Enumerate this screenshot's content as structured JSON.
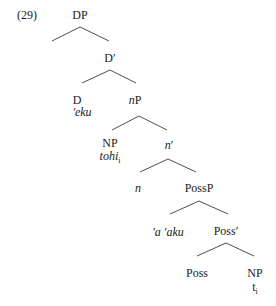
{
  "example_number": "(29)",
  "tree": {
    "nodes": {
      "DP": {
        "label": "DP",
        "x": 80,
        "y": 9
      },
      "Dbar": {
        "label": "D′",
        "x": 110,
        "y": 52
      },
      "D": {
        "label": "D",
        "x": 77,
        "y": 94
      },
      "eku": {
        "label": "'eku",
        "x": 82,
        "y": 106
      },
      "nP_label": {
        "label": "n",
        "x": 134,
        "y": 94
      },
      "nP_suffix": {
        "label": "P"
      },
      "NP1": {
        "label": "NP",
        "x": 110,
        "y": 137
      },
      "tohi": {
        "label": "tohi",
        "subscript": "i",
        "x": 110,
        "y": 150
      },
      "nbar_label": {
        "label": "n",
        "x": 168,
        "y": 139
      },
      "nbar_suffix": {
        "label": "′"
      },
      "n": {
        "label": "n",
        "x": 138,
        "y": 182
      },
      "PossP": {
        "label": "PossP",
        "x": 199,
        "y": 182
      },
      "aaku": {
        "label": "'a 'aku",
        "x": 168,
        "y": 226
      },
      "Possbar": {
        "label": "Poss′",
        "x": 226,
        "y": 225
      },
      "Poss": {
        "label": "Poss",
        "x": 197,
        "y": 267
      },
      "NP2": {
        "label": "NP",
        "x": 255,
        "y": 267
      },
      "trace": {
        "label": "t",
        "subscript": "i",
        "x": 255,
        "y": 281
      }
    },
    "edges": [
      {
        "from": "DP",
        "to": "D′",
        "x1": 80,
        "y1": 27,
        "x2": 52,
        "y2": 41
      },
      {
        "from": "DP",
        "to": "D′",
        "x1": 80,
        "y1": 27,
        "x2": 109,
        "y2": 41
      },
      {
        "from": "D′",
        "to": "D",
        "x1": 110,
        "y1": 70,
        "x2": 82,
        "y2": 83
      },
      {
        "from": "D′",
        "to": "nP",
        "x1": 110,
        "y1": 70,
        "x2": 136,
        "y2": 83
      },
      {
        "from": "nP",
        "to": "NP",
        "x1": 139,
        "y1": 116,
        "x2": 112,
        "y2": 130
      },
      {
        "from": "nP",
        "to": "n′",
        "x1": 139,
        "y1": 116,
        "x2": 167,
        "y2": 130
      },
      {
        "from": "n′",
        "to": "n",
        "x1": 168,
        "y1": 159,
        "x2": 140,
        "y2": 172
      },
      {
        "from": "n′",
        "to": "PossP",
        "x1": 168,
        "y1": 159,
        "x2": 196,
        "y2": 172
      },
      {
        "from": "PossP",
        "to": "'a 'aku",
        "x1": 199,
        "y1": 201,
        "x2": 170,
        "y2": 214
      },
      {
        "from": "PossP",
        "to": "Poss′",
        "x1": 199,
        "y1": 201,
        "x2": 228,
        "y2": 214
      },
      {
        "from": "Poss′",
        "to": "Poss",
        "x1": 226,
        "y1": 243,
        "x2": 197,
        "y2": 256
      },
      {
        "from": "Poss′",
        "to": "NP",
        "x1": 226,
        "y1": 243,
        "x2": 254,
        "y2": 256
      }
    ]
  }
}
